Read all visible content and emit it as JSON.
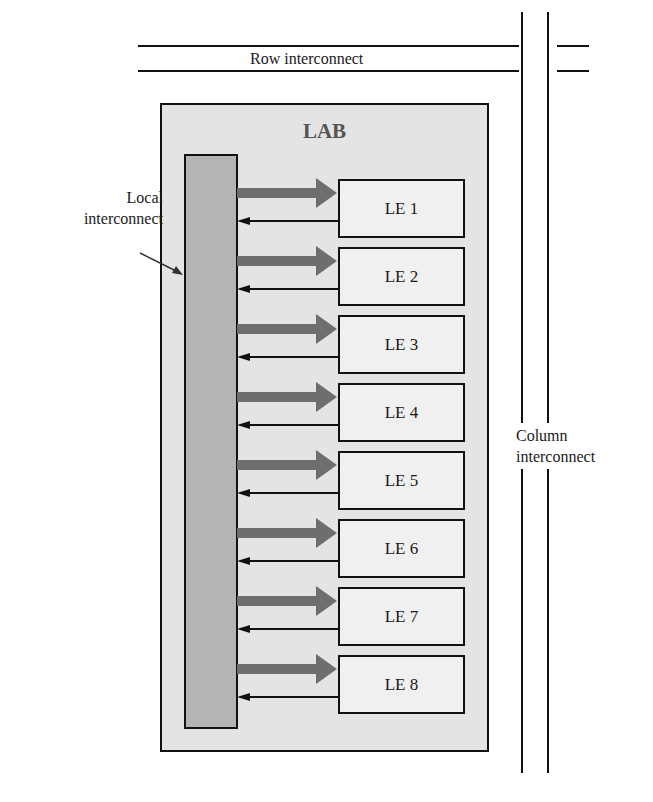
{
  "diagram": {
    "row_interconnect_label": "Row interconnect",
    "column_interconnect_label_line1": "Column",
    "column_interconnect_label_line2": "interconnect",
    "lab_title": "LAB",
    "local_interconnect_label_line1": "Local",
    "local_interconnect_label_line2": "interconnect",
    "logic_elements": [
      "LE 1",
      "LE 2",
      "LE 3",
      "LE 4",
      "LE 5",
      "LE 6",
      "LE 7",
      "LE 8"
    ],
    "colors": {
      "lab_fill": "#e4e4e4",
      "local_bar_fill": "#b4b4b4",
      "le_fill": "#f0f0f0",
      "thick_arrow": "#6e6e6e",
      "line": "#111111"
    }
  }
}
